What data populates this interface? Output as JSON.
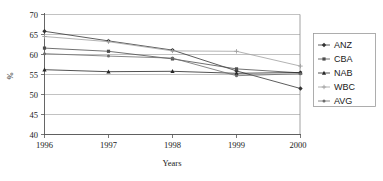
{
  "chart_data": {
    "type": "line",
    "title": "",
    "xlabel": "Years",
    "ylabel": "%",
    "categories": [
      "1996",
      "1997",
      "1998",
      "1999",
      "2000"
    ],
    "x": [
      1996,
      1997,
      1998,
      1999,
      2000
    ],
    "ylim": [
      40,
      70
    ],
    "yticks": [
      40,
      45,
      50,
      55,
      60,
      65,
      70
    ],
    "ytick_labels": [
      "40",
      "45",
      "50",
      "55",
      "60",
      "65",
      "70"
    ],
    "grid": "horizontal",
    "legend_position": "right-outside",
    "series": [
      {
        "name": "ANZ",
        "values": [
          65.8,
          63.4,
          61.1,
          55.9,
          51.5
        ],
        "color": "#333333",
        "marker": "diamond"
      },
      {
        "name": "CBA",
        "values": [
          61.6,
          60.8,
          58.9,
          56.4,
          55.4
        ],
        "color": "#4d4d4d",
        "marker": "square"
      },
      {
        "name": "NAB",
        "values": [
          56.2,
          55.7,
          55.8,
          55.3,
          55.5
        ],
        "color": "#262626",
        "marker": "triangle"
      },
      {
        "name": "WBC",
        "values": [
          64.5,
          63.2,
          60.9,
          60.8,
          57.1
        ],
        "color": "#a0a0a0",
        "marker": "cross"
      },
      {
        "name": "AVG",
        "values": [
          60.2,
          59.6,
          59.1,
          54.7,
          55.2
        ],
        "color": "#6b6b6b",
        "marker": "dot"
      }
    ]
  },
  "legend": {
    "entries": [
      {
        "label": "ANZ"
      },
      {
        "label": "CBA"
      },
      {
        "label": "NAB"
      },
      {
        "label": "WBC"
      },
      {
        "label": "AVG"
      }
    ]
  },
  "axes": {
    "y_title": "%",
    "x_title": "Years",
    "y_tick_0": "40",
    "y_tick_1": "45",
    "y_tick_2": "50",
    "y_tick_3": "55",
    "y_tick_4": "60",
    "y_tick_5": "65",
    "y_tick_6": "70",
    "x_tick_0": "1996",
    "x_tick_1": "1997",
    "x_tick_2": "1998",
    "x_tick_3": "1999",
    "x_tick_4": "2000"
  }
}
